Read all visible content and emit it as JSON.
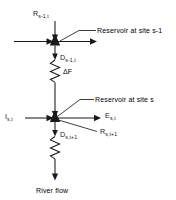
{
  "figure": {
    "type": "schematic-diagram",
    "colors": {
      "ink": "#1a1a1a",
      "background": "#ffffff"
    }
  },
  "labels": {
    "release_upper": {
      "base": "R",
      "sub": "s-1,t",
      "full": "R s-1,t"
    },
    "note_upper": "Reservoir at site s-1",
    "diversion_upper": {
      "base": "D",
      "sub": "s-1,t",
      "full": "D s-1,t"
    },
    "delta_f": "ΔF",
    "note_lower": "Reservoir at site s",
    "inflow": {
      "base": "I",
      "sub": "s,t",
      "full": "I s,t"
    },
    "evaporation": {
      "base": "E",
      "sub": "s,t",
      "full": "E s,t"
    },
    "storage_next": {
      "base": "R",
      "sub": "s,t+1",
      "full": "R s,t+1"
    },
    "diversion_lower": {
      "base": "D",
      "sub": "s,t+1",
      "full": "D s,t+1"
    },
    "river_flow": "River flow"
  },
  "nodes": [
    {
      "id": "node-upper",
      "name": "reservoir-node-upper",
      "x": 55,
      "y": 41
    },
    {
      "id": "node-lower",
      "name": "reservoir-node-lower",
      "x": 55,
      "y": 118
    }
  ],
  "flows": [
    {
      "name": "release-into-upper-node",
      "direction": "down",
      "label": "R s-1,t"
    },
    {
      "name": "inflow-left-upper-node",
      "direction": "right",
      "label": ""
    },
    {
      "name": "outflow-right-upper-node",
      "direction": "right",
      "label": ""
    },
    {
      "name": "diversion-below-upper-node",
      "direction": "down",
      "label": "D s-1,t"
    },
    {
      "name": "reach-loss",
      "direction": "down",
      "label": "ΔF"
    },
    {
      "name": "inflow-left-lower-node",
      "direction": "right",
      "label": "I s,t"
    },
    {
      "name": "evaporation-right-lower-node",
      "direction": "right",
      "label": "E s,t"
    },
    {
      "name": "storage-carryover",
      "direction": "right",
      "label": "R s,t+1"
    },
    {
      "name": "diversion-below-lower-node",
      "direction": "down",
      "label": "D s,t+1"
    },
    {
      "name": "river-flow-out",
      "direction": "down",
      "label": "River flow"
    }
  ]
}
